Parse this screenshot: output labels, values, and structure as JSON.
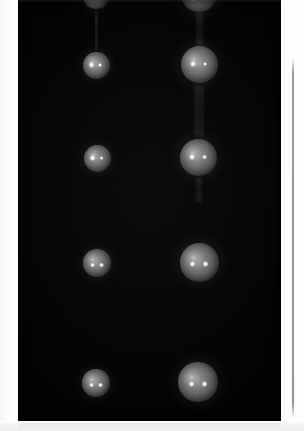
{
  "image": {
    "title": "Vertical pair of illuminated spheres",
    "kind": "scientific-photograph",
    "width": 304,
    "height": 431,
    "background_color": "#ffffff",
    "panel_color": "#030303",
    "alt_text": "Two vertical columns of glowing spherical droplets photographed against a black background, each sphere showing two bright specular highlights"
  },
  "panel": {
    "name": "dark imaging field",
    "x": 18,
    "y": 0,
    "width": 263,
    "height": 421,
    "color": "#030303"
  },
  "columns": [
    {
      "id": "left",
      "label": "left column",
      "center_x": 96,
      "sphere_count": 5
    },
    {
      "id": "right",
      "label": "right column",
      "center_x": 198,
      "sphere_count": 5
    }
  ],
  "spheres": [
    {
      "id": "L1",
      "column": "left",
      "row": 1,
      "cx": 96,
      "cy": -4,
      "r": 13,
      "clipped": "top",
      "highlights": [
        {
          "dx": -4,
          "dy": 2,
          "r": 2.2
        },
        {
          "dx": 4,
          "dy": 2,
          "r": 2.0
        }
      ]
    },
    {
      "id": "L2",
      "column": "left",
      "row": 2,
      "cx": 96,
      "cy": 65,
      "r": 13.5,
      "clipped": "none",
      "highlights": [
        {
          "dx": -4.5,
          "dy": 0,
          "r": 2.6
        },
        {
          "dx": 4.0,
          "dy": 0,
          "r": 2.1
        }
      ]
    },
    {
      "id": "L3",
      "column": "left",
      "row": 3,
      "cx": 97,
      "cy": 158,
      "r": 13.5,
      "clipped": "none",
      "highlights": [
        {
          "dx": -4.5,
          "dy": 0,
          "r": 2.6
        },
        {
          "dx": 4.5,
          "dy": 0,
          "r": 1.9
        }
      ]
    },
    {
      "id": "L4",
      "column": "left",
      "row": 4,
      "cx": 97,
      "cy": 263,
      "r": 14,
      "clipped": "none",
      "highlights": [
        {
          "dx": -4.5,
          "dy": 2,
          "r": 2.4
        },
        {
          "dx": 4.5,
          "dy": 2,
          "r": 2.4
        }
      ]
    },
    {
      "id": "L5",
      "column": "left",
      "row": 5,
      "cx": 96,
      "cy": 383,
      "r": 14,
      "clipped": "none",
      "highlights": [
        {
          "dx": -4.5,
          "dy": 2,
          "r": 2.4
        },
        {
          "dx": 4.5,
          "dy": 2,
          "r": 2.4
        }
      ]
    },
    {
      "id": "R1",
      "column": "right",
      "row": 1,
      "cx": 199,
      "cy": -6,
      "r": 18,
      "clipped": "top",
      "highlights": [
        {
          "dx": -6,
          "dy": 4,
          "r": 2.6
        },
        {
          "dx": 6,
          "dy": 4,
          "r": 2.4
        }
      ]
    },
    {
      "id": "R2",
      "column": "right",
      "row": 2,
      "cx": 199,
      "cy": 64,
      "r": 18.5,
      "clipped": "none",
      "highlights": [
        {
          "dx": -6.5,
          "dy": 0,
          "r": 3.0
        },
        {
          "dx": 6.0,
          "dy": 0,
          "r": 2.3
        }
      ]
    },
    {
      "id": "R3",
      "column": "right",
      "row": 3,
      "cx": 198,
      "cy": 157,
      "r": 18.5,
      "clipped": "none",
      "highlights": [
        {
          "dx": -6.5,
          "dy": 0,
          "r": 3.0
        },
        {
          "dx": 6.5,
          "dy": 0,
          "r": 2.2
        }
      ]
    },
    {
      "id": "R4",
      "column": "right",
      "row": 4,
      "cx": 199,
      "cy": 262,
      "r": 19.5,
      "clipped": "none",
      "highlights": [
        {
          "dx": -6.5,
          "dy": 2,
          "r": 2.8
        },
        {
          "dx": 6.5,
          "dy": 2,
          "r": 2.8
        }
      ]
    },
    {
      "id": "R5",
      "column": "right",
      "row": 5,
      "cx": 198,
      "cy": 382,
      "r": 20,
      "clipped": "none",
      "highlights": [
        {
          "dx": -6.5,
          "dy": 2,
          "r": 2.8
        },
        {
          "dx": 6.5,
          "dy": 2,
          "r": 2.8
        }
      ]
    }
  ],
  "streaks": [
    {
      "id": "S-left-1",
      "column": "left",
      "x": 95,
      "y": 8,
      "w": 3,
      "h": 46
    },
    {
      "id": "S-right-1",
      "column": "right",
      "x": 196,
      "y": 10,
      "w": 7,
      "h": 38
    },
    {
      "id": "S-right-2",
      "column": "right",
      "x": 194,
      "y": 82,
      "w": 10,
      "h": 58
    },
    {
      "id": "S-right-3",
      "column": "right",
      "x": 196,
      "y": 176,
      "w": 6,
      "h": 28
    }
  ],
  "rule": {
    "name": "vertical scale rule",
    "x": 292,
    "y": 58,
    "width": 1.6,
    "height": 360,
    "color": "#8f8f8f"
  },
  "bottom_strip": {
    "name": "lower page margin",
    "y": 421,
    "height": 10,
    "color": "#efefef"
  }
}
